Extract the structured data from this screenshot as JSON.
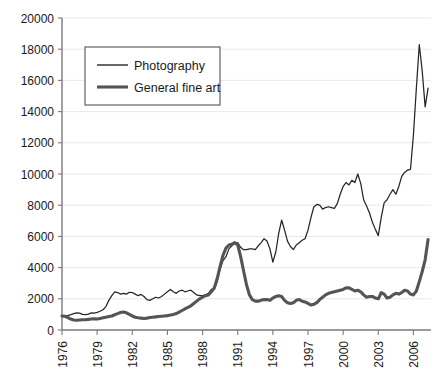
{
  "chart_data": {
    "type": "line",
    "title": "",
    "subtitle": "",
    "xlabel": "",
    "ylabel": "",
    "xlim": [
      1976,
      2007.5
    ],
    "ylim": [
      0,
      20000
    ],
    "grid": true,
    "legend_position": "top-left",
    "y_ticks": [
      0,
      2000,
      4000,
      6000,
      8000,
      10000,
      12000,
      14000,
      16000,
      18000,
      20000
    ],
    "y_tick_labels": [
      "0",
      "2000",
      "4000",
      "6000",
      "8000",
      "10000",
      "12000",
      "14000",
      "16000",
      "18000",
      "20000"
    ],
    "x_ticks": [
      1976,
      1979,
      1982,
      1985,
      1988,
      1991,
      1994,
      1997,
      2000,
      2003,
      2006
    ],
    "x_tick_labels": [
      "1976",
      "1979",
      "1982",
      "1985",
      "1988",
      "1991",
      "1994",
      "1997",
      "2000",
      "2003",
      "2006"
    ],
    "series": [
      {
        "name": "Photography",
        "style": "thin",
        "color": "#262626",
        "x": [
          1976.0,
          1976.25,
          1976.5,
          1976.75,
          1977.0,
          1977.25,
          1977.5,
          1977.75,
          1978.0,
          1978.25,
          1978.5,
          1978.75,
          1979.0,
          1979.25,
          1979.5,
          1979.75,
          1980.0,
          1980.25,
          1980.5,
          1980.75,
          1981.0,
          1981.25,
          1981.5,
          1981.75,
          1982.0,
          1982.25,
          1982.5,
          1982.75,
          1983.0,
          1983.25,
          1983.5,
          1983.75,
          1984.0,
          1984.25,
          1984.5,
          1984.75,
          1985.0,
          1985.25,
          1985.5,
          1985.75,
          1986.0,
          1986.25,
          1986.5,
          1986.75,
          1987.0,
          1987.25,
          1987.5,
          1987.75,
          1988.0,
          1988.25,
          1988.5,
          1988.75,
          1989.0,
          1989.25,
          1989.5,
          1989.75,
          1990.0,
          1990.25,
          1990.5,
          1990.75,
          1991.0,
          1991.25,
          1991.5,
          1991.75,
          1992.0,
          1992.25,
          1992.5,
          1992.75,
          1993.0,
          1993.25,
          1993.5,
          1993.75,
          1994.0,
          1994.25,
          1994.5,
          1994.75,
          1995.0,
          1995.25,
          1995.5,
          1995.75,
          1996.0,
          1996.25,
          1996.5,
          1996.75,
          1997.0,
          1997.25,
          1997.5,
          1997.75,
          1998.0,
          1998.25,
          1998.5,
          1998.75,
          1999.0,
          1999.25,
          1999.5,
          1999.75,
          2000.0,
          2000.25,
          2000.5,
          2000.75,
          2001.0,
          2001.25,
          2001.5,
          2001.75,
          2002.0,
          2002.25,
          2002.5,
          2002.75,
          2003.0,
          2003.25,
          2003.5,
          2003.75,
          2004.0,
          2004.25,
          2004.5,
          2004.75,
          2005.0,
          2005.25,
          2005.5,
          2005.75,
          2006.0,
          2006.25,
          2006.5,
          2006.75,
          2007.0,
          2007.25
        ],
        "values": [
          900,
          900,
          920,
          980,
          1050,
          1100,
          1080,
          1000,
          980,
          1020,
          1100,
          1080,
          1130,
          1200,
          1300,
          1500,
          1900,
          2200,
          2450,
          2400,
          2300,
          2350,
          2300,
          2420,
          2400,
          2300,
          2200,
          2280,
          2150,
          1950,
          1900,
          2000,
          2100,
          2050,
          2150,
          2300,
          2450,
          2600,
          2450,
          2350,
          2500,
          2550,
          2450,
          2500,
          2550,
          2400,
          2250,
          2200,
          2200,
          2250,
          2350,
          2600,
          2600,
          3100,
          3900,
          4450,
          4700,
          5200,
          5400,
          5550,
          5600,
          5300,
          5150,
          5150,
          5200,
          5200,
          5150,
          5400,
          5600,
          5850,
          5700,
          5200,
          4350,
          5000,
          6200,
          7050,
          6400,
          5700,
          5350,
          5150,
          5450,
          5600,
          5750,
          5850,
          6400,
          7200,
          7900,
          8050,
          8000,
          7750,
          7850,
          7900,
          7850,
          7800,
          8100,
          8700,
          9200,
          9450,
          9300,
          9600,
          9450,
          10000,
          9400,
          8350,
          7950,
          7500,
          6900,
          6450,
          6050,
          7200,
          8150,
          8350,
          8700,
          9000,
          8700,
          9200,
          9850,
          10100,
          10250,
          10300,
          12500,
          15500,
          18300,
          16600,
          14300,
          15500
        ]
      },
      {
        "name": "General fine art",
        "style": "thick",
        "color": "#555555",
        "x": [
          1976.0,
          1976.25,
          1976.5,
          1976.75,
          1977.0,
          1977.25,
          1977.5,
          1977.75,
          1978.0,
          1978.25,
          1978.5,
          1978.75,
          1979.0,
          1979.25,
          1979.5,
          1979.75,
          1980.0,
          1980.25,
          1980.5,
          1980.75,
          1981.0,
          1981.25,
          1981.5,
          1981.75,
          1982.0,
          1982.25,
          1982.5,
          1982.75,
          1983.0,
          1983.25,
          1983.5,
          1983.75,
          1984.0,
          1984.25,
          1984.5,
          1984.75,
          1985.0,
          1985.25,
          1985.5,
          1985.75,
          1986.0,
          1986.25,
          1986.5,
          1986.75,
          1987.0,
          1987.25,
          1987.5,
          1987.75,
          1988.0,
          1988.25,
          1988.5,
          1988.75,
          1989.0,
          1989.25,
          1989.5,
          1989.75,
          1990.0,
          1990.25,
          1990.5,
          1990.75,
          1991.0,
          1991.25,
          1991.5,
          1991.75,
          1992.0,
          1992.25,
          1992.5,
          1992.75,
          1993.0,
          1993.25,
          1993.5,
          1993.75,
          1994.0,
          1994.25,
          1994.5,
          1994.75,
          1995.0,
          1995.25,
          1995.5,
          1995.75,
          1996.0,
          1996.25,
          1996.5,
          1996.75,
          1997.0,
          1997.25,
          1997.5,
          1997.75,
          1998.0,
          1998.25,
          1998.5,
          1998.75,
          1999.0,
          1999.25,
          1999.5,
          1999.75,
          2000.0,
          2000.25,
          2000.5,
          2000.75,
          2001.0,
          2001.25,
          2001.5,
          2001.75,
          2002.0,
          2002.25,
          2002.5,
          2002.75,
          2003.0,
          2003.25,
          2003.5,
          2003.75,
          2004.0,
          2004.25,
          2004.5,
          2004.75,
          2005.0,
          2005.25,
          2005.5,
          2005.75,
          2006.0,
          2006.25,
          2006.5,
          2006.75,
          2007.0,
          2007.25
        ],
        "values": [
          900,
          880,
          800,
          700,
          640,
          620,
          640,
          660,
          660,
          680,
          700,
          720,
          700,
          740,
          780,
          820,
          860,
          900,
          980,
          1050,
          1120,
          1150,
          1100,
          1000,
          900,
          820,
          780,
          760,
          740,
          760,
          800,
          820,
          840,
          860,
          880,
          900,
          920,
          960,
          1000,
          1050,
          1150,
          1250,
          1350,
          1450,
          1550,
          1700,
          1850,
          2000,
          2100,
          2200,
          2250,
          2450,
          2700,
          3300,
          4100,
          4800,
          5250,
          5450,
          5500,
          5600,
          5450,
          4700,
          3800,
          2900,
          2250,
          1950,
          1850,
          1850,
          1900,
          1950,
          1950,
          1900,
          2050,
          2150,
          2200,
          2150,
          1900,
          1750,
          1700,
          1750,
          1900,
          1950,
          1850,
          1800,
          1700,
          1600,
          1650,
          1750,
          1950,
          2100,
          2250,
          2350,
          2400,
          2450,
          2500,
          2550,
          2600,
          2700,
          2700,
          2600,
          2500,
          2550,
          2450,
          2250,
          2100,
          2150,
          2150,
          2050,
          2000,
          2400,
          2300,
          2050,
          2100,
          2250,
          2350,
          2300,
          2400,
          2550,
          2500,
          2300,
          2250,
          2500,
          3100,
          3750,
          4500,
          5800
        ]
      }
    ]
  },
  "legend": {
    "items": [
      {
        "label": "Photography",
        "swatch": "thin-line-swatch"
      },
      {
        "label": "General fine art",
        "swatch": "thick-line-swatch"
      }
    ]
  }
}
